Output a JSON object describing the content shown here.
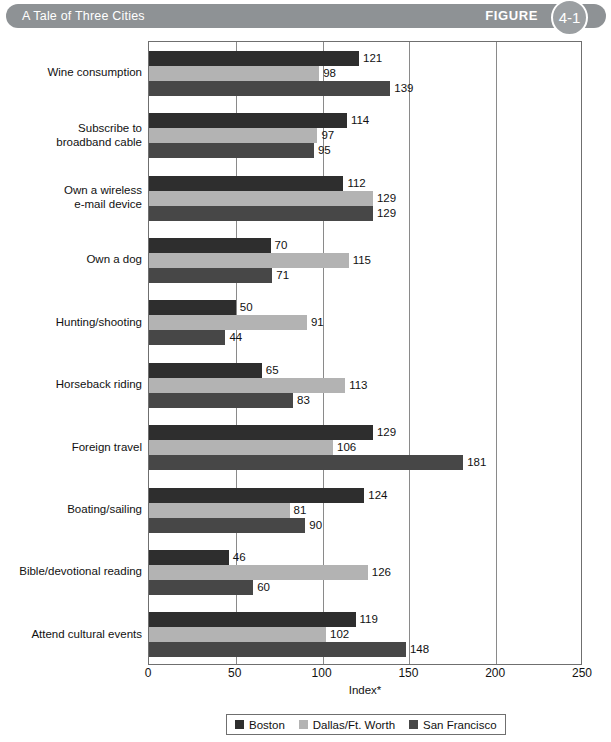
{
  "header": {
    "title": "A Tale of Three Cities",
    "figure_word": "FIGURE",
    "figure_number": "4-1",
    "banner_color": "#8e9295",
    "badge_color": "#9b9fa2"
  },
  "chart_data": {
    "type": "bar",
    "orientation": "horizontal",
    "title": "A Tale of Three Cities",
    "xlabel": "Index*",
    "ylabel": "",
    "xlim": [
      0,
      250
    ],
    "xticks": [
      0,
      50,
      100,
      150,
      200,
      250
    ],
    "grid": true,
    "legend_position": "bottom",
    "categories": [
      "Wine consumption",
      "Subscribe to\nbroadband cable",
      "Own a wireless\ne-mail device",
      "Own a dog",
      "Hunting/shooting",
      "Horseback riding",
      "Foreign travel",
      "Boating/sailing",
      "Bible/devotional reading",
      "Attend cultural events"
    ],
    "series": [
      {
        "name": "Boston",
        "color": "#2e2e2e",
        "values": [
          121,
          114,
          112,
          70,
          50,
          65,
          129,
          124,
          46,
          119
        ]
      },
      {
        "name": "Dallas/Ft. Worth",
        "color": "#b3b3b3",
        "values": [
          98,
          97,
          129,
          115,
          91,
          113,
          106,
          81,
          126,
          102
        ]
      },
      {
        "name": "San Francisco",
        "color": "#474747",
        "values": [
          139,
          95,
          129,
          71,
          44,
          83,
          181,
          90,
          60,
          148
        ]
      }
    ]
  },
  "legend": {
    "items": [
      {
        "label": "Boston",
        "color": "#2e2e2e"
      },
      {
        "label": "Dallas/Ft. Worth",
        "color": "#b3b3b3"
      },
      {
        "label": "San Francisco",
        "color": "#474747"
      }
    ]
  }
}
